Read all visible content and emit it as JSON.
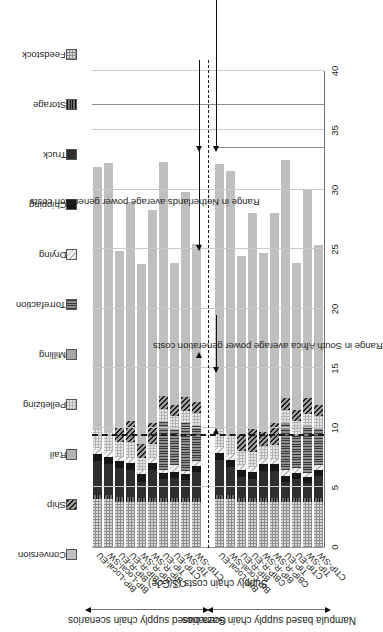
{
  "figure": {
    "ylabel": "Supply chain costs ($/GJe)",
    "yticks": [
      "0",
      "5",
      "10",
      "15",
      "20",
      "25",
      "30",
      "35",
      "40"
    ],
    "ylim": [
      0,
      40
    ],
    "annotations": [
      {
        "id": "sa-range",
        "text": "Range in South Africa average power generation costs"
      },
      {
        "id": "nl-range",
        "text": "Range in Netherlands average power generation costs"
      }
    ],
    "group_titles": [
      {
        "id": "gaza",
        "text": "Gaza based supply chain scenarios"
      },
      {
        "id": "nampula",
        "text": "Nampula based supply chain scenarios"
      }
    ]
  },
  "legend": {
    "entries": [
      {
        "label": "Conversion",
        "color": "#bfbfbf",
        "pattern": "solid-light"
      },
      {
        "label": "Ship",
        "color": "#3f3f3f",
        "pattern": "diagonal-dark"
      },
      {
        "label": "Rail",
        "color": "#b0b0b0",
        "pattern": "solid-mid"
      },
      {
        "label": "Pelletizing",
        "color": "#d8d8d8",
        "pattern": "checker-light"
      },
      {
        "label": "Milling",
        "color": "#a8a8a8",
        "pattern": "solid-grey"
      },
      {
        "label": "Torrefaction",
        "color": "#7a7a7a",
        "pattern": "vertical-lines"
      },
      {
        "label": "Drying",
        "color": "#ededed",
        "pattern": "diagonal-faint"
      },
      {
        "label": "Chipping",
        "color": "#1a1a1a",
        "pattern": "solid-black"
      },
      {
        "label": "Truck",
        "color": "#2e2e2e",
        "pattern": "solid-darkgrey"
      },
      {
        "label": "Storage",
        "color": "#555555",
        "pattern": "horizontal-lines"
      },
      {
        "label": "Feedstock",
        "color": "#cccccc",
        "pattern": "checker-mid"
      }
    ]
  },
  "chart_data": {
    "type": "bar",
    "title": "",
    "xlabel": "",
    "ylabel": "Supply chain costs ($/GJe)",
    "ylim": [
      0,
      40
    ],
    "grid": true,
    "legend_position": "top",
    "stacked": true,
    "orientation": "vertical",
    "categories": [
      "BtP-Local-EU",
      "BtP-Local-SW",
      "BtP-R-EU",
      "CBtP-R-EU",
      "BtP-R-SW",
      "CBtP-R-SW",
      "TtP-EU",
      "CTtP-EU",
      "TtP-SW",
      "CTtP-SW",
      "BtP-Local-EU",
      "BtP-Local-SW",
      "BtP-R-EU",
      "CBtP-R-EU",
      "BtP-R-SW",
      "CBtP-R-SW",
      "TtP-EU",
      "CTtP-EU",
      "TtP-SW",
      "CTtP-SW"
    ],
    "groups": [
      {
        "name": "Gaza based supply chain scenarios",
        "start": 0,
        "end": 9
      },
      {
        "name": "Nampula based supply chain scenarios",
        "start": 10,
        "end": 19
      }
    ],
    "series": [
      {
        "name": "Feedstock",
        "values": [
          4.0,
          4.0,
          3.8,
          3.8,
          3.8,
          3.8,
          3.8,
          3.8,
          3.8,
          3.8,
          4.0,
          4.0,
          3.8,
          3.8,
          3.8,
          3.8,
          3.8,
          3.8,
          3.8,
          3.8
        ]
      },
      {
        "name": "Storage",
        "values": [
          0.4,
          0.4,
          0.4,
          0.4,
          0.3,
          0.3,
          0.3,
          0.3,
          0.3,
          0.3,
          0.4,
          0.4,
          0.3,
          0.3,
          0.3,
          0.3,
          0.3,
          0.3,
          0.3,
          0.3
        ]
      },
      {
        "name": "Truck",
        "values": [
          2.8,
          2.6,
          2.4,
          2.3,
          1.4,
          2.4,
          1.6,
          1.7,
          1.5,
          2.2,
          2.9,
          2.3,
          1.8,
          1.6,
          2.3,
          2.3,
          1.4,
          1.6,
          1.3,
          1.9
        ]
      },
      {
        "name": "Chipping",
        "values": [
          0.6,
          0.6,
          0.6,
          0.6,
          0.6,
          0.6,
          0.5,
          0.5,
          0.5,
          0.5,
          0.6,
          0.6,
          0.6,
          0.6,
          0.6,
          0.6,
          0.5,
          0.5,
          0.5,
          0.5
        ]
      },
      {
        "name": "Drying",
        "values": [
          0.5,
          0.5,
          0.4,
          0.4,
          0.4,
          0.4,
          0.3,
          0.6,
          0.3,
          0.4,
          0.5,
          0.5,
          0.4,
          0.4,
          0.4,
          0.4,
          0.5,
          0.4,
          0.3,
          0.4
        ]
      },
      {
        "name": "Torrefaction",
        "values": [
          0.0,
          0.0,
          0.0,
          0.0,
          0.0,
          0.0,
          4.0,
          2.9,
          4.0,
          3.0,
          0.0,
          0.0,
          0.0,
          0.0,
          0.0,
          0.0,
          3.9,
          2.8,
          4.0,
          3.0
        ]
      },
      {
        "name": "Milling",
        "values": [
          0.0,
          0.0,
          0.0,
          0.0,
          0.0,
          0.0,
          0.0,
          0.0,
          0.0,
          0.0,
          0.0,
          0.0,
          0.0,
          0.0,
          0.0,
          0.0,
          0.0,
          0.0,
          0.0,
          0.0
        ]
      },
      {
        "name": "Pelletizing",
        "values": [
          1.6,
          1.5,
          1.2,
          1.3,
          1.0,
          1.2,
          1.1,
          1.2,
          1.0,
          1.1,
          1.6,
          1.5,
          1.2,
          1.3,
          1.1,
          1.2,
          1.1,
          1.2,
          1.0,
          1.1
        ]
      },
      {
        "name": "Rail",
        "values": [
          0.0,
          0.0,
          0.0,
          0.0,
          0.0,
          0.0,
          0.0,
          0.0,
          0.0,
          0.0,
          0.0,
          0.0,
          0.0,
          0.0,
          0.0,
          0.0,
          0.0,
          0.0,
          0.0,
          0.0
        ]
      },
      {
        "name": "Ship",
        "values": [
          0.0,
          0.0,
          1.3,
          1.8,
          1.2,
          1.7,
          1.1,
          0.9,
          1.2,
          0.9,
          0.0,
          0.0,
          1.3,
          1.9,
          1.2,
          1.8,
          1.0,
          0.9,
          1.3,
          0.9
        ]
      },
      {
        "name": "Conversion",
        "values": [
          22.0,
          22.7,
          14.8,
          18.4,
          15.1,
          17.9,
          19.7,
          12.0,
          17.2,
          13.3,
          22.2,
          22.3,
          15.1,
          18.2,
          15.0,
          17.7,
          20.0,
          12.4,
          17.5,
          13.5
        ]
      }
    ],
    "reference_lines": [
      {
        "label": "South Africa lower bound",
        "value": 9.4,
        "style": "dashed"
      }
    ]
  }
}
